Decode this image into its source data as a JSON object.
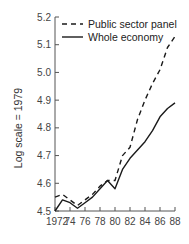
{
  "chart_data": {
    "type": "line",
    "title": "",
    "xlabel": "",
    "ylabel": "Log scale = 1979",
    "xlim": [
      1972,
      1988
    ],
    "ylim": [
      4.5,
      5.2
    ],
    "grid": false,
    "legend_position": "top-right",
    "x_tick_labels": [
      "1972",
      "74",
      "76",
      "78",
      "80",
      "82",
      "84",
      "86",
      "88"
    ],
    "y_tick_labels": [
      "4.5",
      "4.6",
      "4.7",
      "4.8",
      "4.9",
      "5.0",
      "5.1",
      "5.2"
    ],
    "x": [
      1972,
      1973,
      1974,
      1975,
      1976,
      1977,
      1978,
      1979,
      1980,
      1981,
      1982,
      1983,
      1984,
      1985,
      1986,
      1987,
      1988
    ],
    "series": [
      {
        "name": "Public sector panel",
        "style": "dashed",
        "color": "#1a1a1a",
        "values": [
          4.55,
          4.56,
          4.54,
          4.52,
          4.54,
          4.56,
          4.59,
          4.61,
          4.61,
          4.7,
          4.73,
          4.83,
          4.9,
          4.96,
          5.01,
          5.09,
          5.13
        ]
      },
      {
        "name": "Whole economy",
        "style": "solid",
        "color": "#1a1a1a",
        "values": [
          4.5,
          4.54,
          4.53,
          4.51,
          4.53,
          4.55,
          4.58,
          4.61,
          4.58,
          4.65,
          4.69,
          4.72,
          4.75,
          4.79,
          4.84,
          4.87,
          4.89
        ]
      }
    ]
  }
}
